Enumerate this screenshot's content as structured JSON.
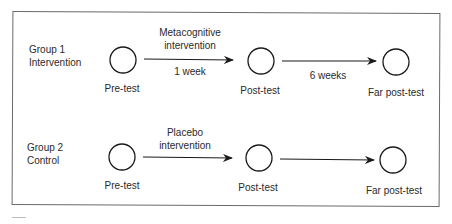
{
  "groups": [
    {
      "label_line1": "Group 1",
      "label_line2": "Intervention",
      "nodes": [
        "Pre-test",
        "Post-test",
        "Far post-test"
      ],
      "edge1_top_line1": "Metacognitive",
      "edge1_top_line2": "intervention",
      "edge1_bottom": "1 week",
      "edge2_bottom": "6 weeks"
    },
    {
      "label_line1": "Group 2",
      "label_line2": "Control",
      "nodes": [
        "Pre-test",
        "Post-test",
        "Far post-test"
      ],
      "edge1_top_line1": "Placebo",
      "edge1_top_line2": "intervention"
    }
  ],
  "colors": {
    "stroke": "#1a1a1a",
    "frame": "#6a6a6a",
    "text": "#2a2a2a"
  }
}
